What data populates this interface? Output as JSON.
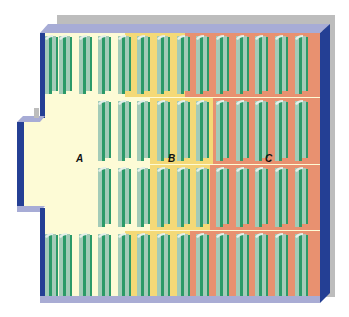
{
  "diagram": {
    "type": "warehouse-floor-plan",
    "zones": [
      {
        "id": "A",
        "label": "A",
        "color": "#fdfbd6",
        "label_x": 80,
        "label_y": 162
      },
      {
        "id": "B",
        "label": "B",
        "color": "#f4d977",
        "label_x": 172,
        "label_y": 162
      },
      {
        "id": "C",
        "label": "C",
        "color": "#e89170",
        "label_x": 269,
        "label_y": 162
      }
    ],
    "colors": {
      "back_wall": "#bdbdbd",
      "rim": "#a7acd6",
      "side_wall": "#243f94",
      "floor_edge": "#a9acd4",
      "rack_dark": "#2b9a68",
      "rack_light": "#a3cbb8",
      "rack_cap": "#e4efe9"
    },
    "rows": [
      {
        "y": 33,
        "h": 62,
        "start_x": 45,
        "zone_bounds": [
          125,
          185
        ]
      },
      {
        "y": 98,
        "h": 64,
        "start_x": 98,
        "zone_bounds": [
          150,
          213
        ]
      },
      {
        "y": 165,
        "h": 63,
        "start_x": 98,
        "zone_bounds": [
          150,
          210
        ]
      },
      {
        "y": 231,
        "h": 69,
        "start_x": 45,
        "zone_bounds": [
          125,
          190
        ]
      }
    ],
    "rack_columns_x": [
      45,
      59,
      79,
      98,
      118,
      137,
      157,
      177,
      196,
      216,
      236,
      255,
      275,
      295
    ],
    "rack_column_count": 14,
    "row_count": 4
  }
}
